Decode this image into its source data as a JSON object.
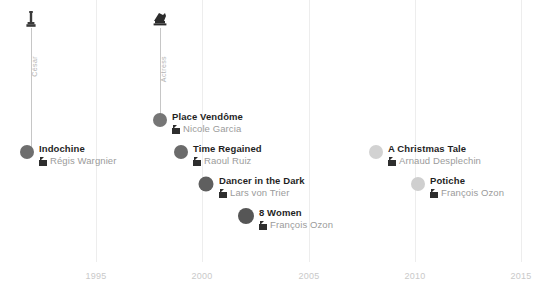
{
  "chart_data": {
    "type": "scatter",
    "title": "",
    "xlabel": "",
    "ylabel": "",
    "xlim": [
      1992.2,
      2016.5
    ],
    "grid": true,
    "legend_position": "none",
    "tick_labels": [
      "1995",
      "2000",
      "2005",
      "2010",
      "2015"
    ],
    "tick_values": [
      1995,
      2000,
      2005,
      2010,
      2015
    ],
    "series": [
      {
        "name": "Films",
        "points": [
          {
            "year": 1992,
            "title": "Indochine",
            "director": "Régis Wargnier",
            "color": "#6e6e6e",
            "radius": 7
          },
          {
            "year": 1998,
            "title": "Place Vendôme",
            "director": "Nicole Garcia",
            "color": "#767676",
            "radius": 7
          },
          {
            "year": 1999,
            "title": "Time Regained",
            "director": "Raoul Ruiz",
            "color": "#6b6b6b",
            "radius": 7
          },
          {
            "year": 2000,
            "title": "Dancer in the Dark",
            "director": "Lars von Trier",
            "color": "#5f5f5f",
            "radius": 8
          },
          {
            "year": 2002,
            "title": "8 Women",
            "director": "François Ozon",
            "color": "#565656",
            "radius": 8
          },
          {
            "year": 2008,
            "title": "A Christmas Tale",
            "director": "Arnaud Desplechin",
            "color": "#d2d2d2",
            "radius": 7
          },
          {
            "year": 2010,
            "title": "Potiche",
            "director": "François Ozon",
            "color": "#cfcfcf",
            "radius": 7
          }
        ]
      }
    ],
    "awards": [
      {
        "year": 1992,
        "caption": "César",
        "icon": "trophy-icon",
        "glyph": "♙",
        "links_to": "Indochine"
      },
      {
        "year": 1998,
        "caption": "Actress",
        "icon": "actress-award-icon",
        "glyph": "♞",
        "links_to": "Place Vendôme"
      }
    ],
    "annotations": []
  },
  "axis": {
    "ticks": [
      {
        "label": "1995",
        "x": 96
      },
      {
        "label": "2000",
        "x": 202
      },
      {
        "label": "2005",
        "x": 309
      },
      {
        "label": "2010",
        "x": 415
      },
      {
        "label": "2015",
        "x": 521
      }
    ]
  },
  "films": [
    {
      "title": "Indochine",
      "director": "Régis Wargnier",
      "dot_x": 27,
      "dot_y": 152,
      "r": 7,
      "color": "#6e6e6e",
      "text_x": 39,
      "text_y": 143
    },
    {
      "title": "Place Vendôme",
      "director": "Nicole Garcia",
      "dot_x": 160,
      "dot_y": 120,
      "r": 7,
      "color": "#767676",
      "text_x": 172,
      "text_y": 111
    },
    {
      "title": "Time Regained",
      "director": "Raoul Ruiz",
      "dot_x": 181,
      "dot_y": 152,
      "r": 7,
      "color": "#6b6b6b",
      "text_x": 193,
      "text_y": 143
    },
    {
      "title": "Dancer in the Dark",
      "director": "Lars von Trier",
      "dot_x": 206,
      "dot_y": 184,
      "r": 7.5,
      "color": "#5f5f5f",
      "text_x": 219,
      "text_y": 175
    },
    {
      "title": "8 Women",
      "director": "François Ozon",
      "dot_x": 246,
      "dot_y": 216,
      "r": 8,
      "color": "#565656",
      "text_x": 259,
      "text_y": 207
    },
    {
      "title": "A Christmas Tale",
      "director": "Arnaud Desplechin",
      "dot_x": 376,
      "dot_y": 152,
      "r": 7,
      "color": "#d2d2d2",
      "text_x": 388,
      "text_y": 143
    },
    {
      "title": "Potiche",
      "director": "François Ozon",
      "dot_x": 418,
      "dot_y": 184,
      "r": 7,
      "color": "#cfcfcf",
      "text_x": 430,
      "text_y": 175
    }
  ],
  "awards": [
    {
      "caption": "César",
      "x": 31,
      "icon_top": 10,
      "stem_top": 28,
      "stem_bottom": 152,
      "cap_top": 56
    },
    {
      "caption": "Actress",
      "x": 160,
      "icon_top": 10,
      "stem_top": 28,
      "stem_bottom": 120,
      "cap_top": 56
    }
  ]
}
